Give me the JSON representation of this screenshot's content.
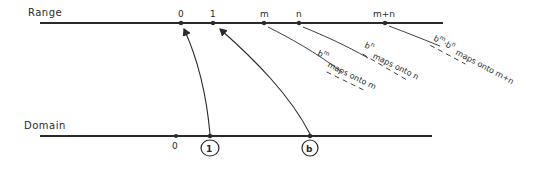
{
  "diagram": {
    "range": {
      "label": "Range",
      "points": [
        {
          "label": "0",
          "x": 181
        },
        {
          "label": "1",
          "x": 213
        },
        {
          "label": "m",
          "x": 264
        },
        {
          "label": "n",
          "x": 299
        },
        {
          "label": "m+n",
          "x": 385
        }
      ]
    },
    "domain": {
      "label": "Domain",
      "points": [
        {
          "label": "0",
          "x": 176,
          "circled": false
        },
        {
          "label": "1",
          "x": 210,
          "circled": true
        },
        {
          "label": "b",
          "x": 310,
          "circled": true
        }
      ]
    },
    "mappings": [
      {
        "from": "1",
        "to": "0"
      },
      {
        "from": "b",
        "to": "1"
      }
    ],
    "annotations": [
      {
        "base": "b",
        "exp": "m",
        "text": "maps onto m"
      },
      {
        "base": "b",
        "exp": "n",
        "text": "maps onto n"
      },
      {
        "base": "b",
        "exp": "m",
        "mid": "·",
        "base2": "b",
        "exp2": "n",
        "text": "maps onto m+n"
      }
    ],
    "colors": {
      "ink": "#2a2a2a",
      "background": "#ffffff"
    }
  }
}
